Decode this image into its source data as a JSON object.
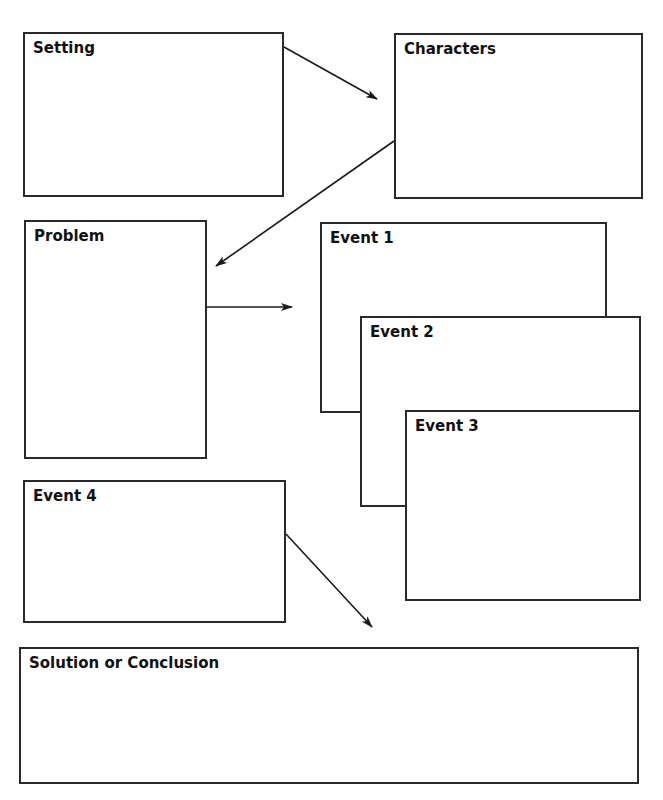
{
  "diagram": {
    "type": "story-map graphic organizer",
    "boxes": {
      "setting": {
        "label": "Setting"
      },
      "characters": {
        "label": "Characters"
      },
      "problem": {
        "label": "Problem"
      },
      "event1": {
        "label": "Event 1"
      },
      "event2": {
        "label": "Event 2"
      },
      "event3": {
        "label": "Event 3"
      },
      "event4": {
        "label": "Event 4"
      },
      "solution": {
        "label": "Solution or Conclusion"
      }
    },
    "arrows": [
      {
        "from": "Setting",
        "to": "Characters"
      },
      {
        "from": "Characters",
        "to": "Problem"
      },
      {
        "from": "Problem",
        "to": "Event 1"
      },
      {
        "from": "Event 4",
        "to": "Solution or Conclusion"
      }
    ],
    "colors": {
      "stroke": "#2a2a2a",
      "text": "#111111",
      "background": "#ffffff"
    }
  }
}
